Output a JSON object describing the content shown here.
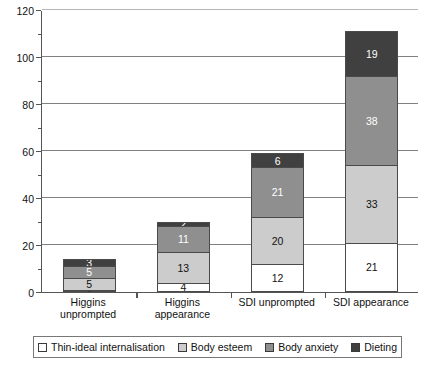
{
  "chart_data": {
    "type": "bar",
    "stacked": true,
    "title": "",
    "xlabel": "",
    "ylabel": "",
    "ylim": [
      0,
      120
    ],
    "ytick_step": 20,
    "yminor_step": 10,
    "grid": true,
    "legend_position": "bottom",
    "categories": [
      "Higgins unprompted",
      "Higgins appearance",
      "SDI unprompted",
      "SDI appearance"
    ],
    "category_lines": [
      [
        "Higgins",
        "unprompted"
      ],
      [
        "Higgins",
        "appearance"
      ],
      [
        "SDI unprompted",
        ""
      ],
      [
        "SDI appearance",
        ""
      ]
    ],
    "yticks": [
      "0",
      "20",
      "40",
      "60",
      "80",
      "100",
      "120"
    ],
    "series": [
      {
        "name": "Thin-ideal internalisation",
        "color": "#ffffff",
        "values": [
          1,
          4,
          12,
          21
        ]
      },
      {
        "name": "Body esteem",
        "color": "#cccccc",
        "values": [
          5,
          13,
          20,
          33
        ]
      },
      {
        "name": "Body anxiety",
        "color": "#8f8f8f",
        "values": [
          5,
          11,
          21,
          38
        ]
      },
      {
        "name": "Dieting",
        "color": "#404040",
        "values": [
          3,
          2,
          6,
          19
        ]
      }
    ],
    "totals": [
      14,
      30,
      59,
      111
    ]
  },
  "legend": {
    "items": [
      {
        "label": "Thin-ideal internalisation",
        "color": "#ffffff"
      },
      {
        "label": "Body esteem",
        "color": "#cccccc"
      },
      {
        "label": "Body anxiety",
        "color": "#8f8f8f"
      },
      {
        "label": "Dieting",
        "color": "#404040"
      }
    ]
  },
  "colors": {
    "axis": "#555555",
    "grid": "#808080",
    "bar_border": "#4a4a4a",
    "text": "#111111",
    "background": "#ffffff"
  }
}
